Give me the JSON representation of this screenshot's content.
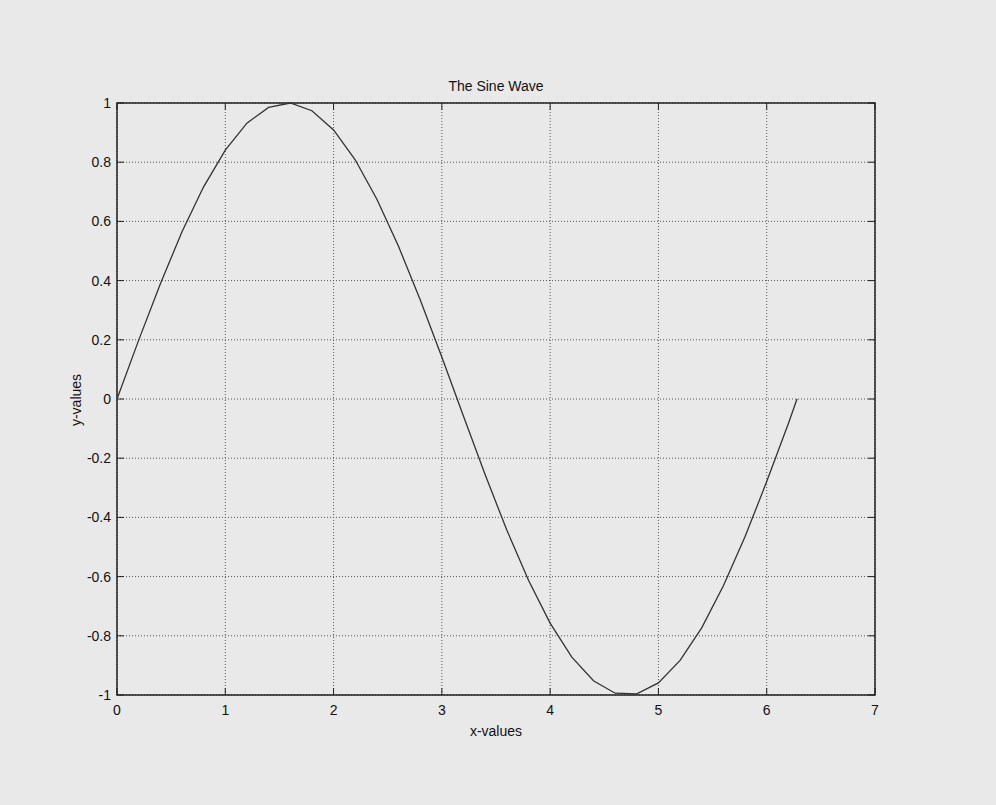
{
  "chart_data": {
    "type": "line",
    "title": "The Sine Wave",
    "xlabel": "x-values",
    "ylabel": "y-values",
    "xlim": [
      0,
      7
    ],
    "ylim": [
      -1,
      1
    ],
    "xticks": [
      "0",
      "1",
      "2",
      "3",
      "4",
      "5",
      "6",
      "7"
    ],
    "yticks": [
      "-1",
      "-0.8",
      "-0.6",
      "-0.4",
      "-0.2",
      "0",
      "0.2",
      "0.4",
      "0.6",
      "0.8",
      "1"
    ],
    "grid": true,
    "series": [
      {
        "name": "sin(x)",
        "x": [
          0,
          0.2,
          0.4,
          0.6,
          0.8,
          1.0,
          1.2,
          1.4,
          1.6,
          1.8,
          2.0,
          2.2,
          2.4,
          2.6,
          2.8,
          3.0,
          3.2,
          3.4,
          3.6,
          3.8,
          4.0,
          4.2,
          4.4,
          4.6,
          4.8,
          5.0,
          5.2,
          5.4,
          5.6,
          5.8,
          6.0,
          6.2,
          6.28
        ],
        "y": [
          0,
          0.199,
          0.389,
          0.565,
          0.717,
          0.841,
          0.932,
          0.985,
          1.0,
          0.974,
          0.909,
          0.808,
          0.675,
          0.516,
          0.335,
          0.141,
          -0.058,
          -0.256,
          -0.443,
          -0.612,
          -0.757,
          -0.872,
          -0.952,
          -0.994,
          -0.996,
          -0.959,
          -0.883,
          -0.773,
          -0.631,
          -0.465,
          -0.279,
          -0.083,
          0.0
        ]
      }
    ]
  }
}
